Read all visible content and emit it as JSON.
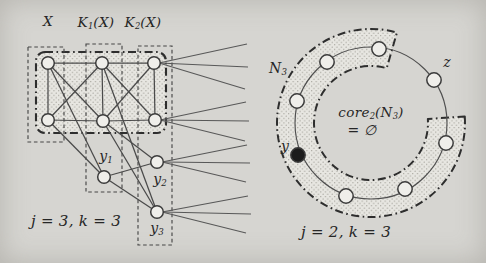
{
  "colors": {
    "paper": "#d6d5d1",
    "ink": "#4a4a4a",
    "heavy_ink": "#2e2e2e",
    "node_fill": "#efeeea",
    "filled_node": "#1c1c1c",
    "stipple_bg": "#e7e6e1",
    "stipple_dot": "#99978f"
  },
  "left_diagram": {
    "label_x": {
      "parts": [
        {
          "t": "X"
        }
      ]
    },
    "label_k1": {
      "parts": [
        {
          "t": "K"
        },
        {
          "s": "1"
        },
        {
          "t": "(X)"
        }
      ]
    },
    "label_k2": {
      "parts": [
        {
          "t": "K"
        },
        {
          "s": "2"
        },
        {
          "t": "(X)"
        }
      ]
    },
    "label_y1": {
      "parts": [
        {
          "t": "y"
        },
        {
          "s": "1"
        }
      ]
    },
    "label_y2": {
      "parts": [
        {
          "t": "y"
        },
        {
          "s": "2"
        }
      ]
    },
    "label_y3": {
      "parts": [
        {
          "t": "y"
        },
        {
          "s": "3"
        }
      ]
    },
    "caption": "j = 3, k = 3",
    "nodes": {
      "t1": [
        48,
        63
      ],
      "t2": [
        102,
        63
      ],
      "t3": [
        154,
        63
      ],
      "b1": [
        48,
        120
      ],
      "b2": [
        103,
        121
      ],
      "b3": [
        155,
        120
      ],
      "y1": [
        104,
        177
      ],
      "y2": [
        157,
        162
      ],
      "y3": [
        157,
        212
      ]
    },
    "edges": [
      [
        "t1",
        "t2"
      ],
      [
        "t2",
        "t3"
      ],
      [
        "b1",
        "b2"
      ],
      [
        "b2",
        "b3"
      ],
      [
        "t1",
        "b1"
      ],
      [
        "t2",
        "b2"
      ],
      [
        "t3",
        "b3"
      ],
      [
        "t1",
        "b2"
      ],
      [
        "b1",
        "t2"
      ],
      [
        "t2",
        "b3"
      ],
      [
        "b2",
        "t3"
      ],
      [
        "t1",
        "y1"
      ],
      [
        "b1",
        "y1"
      ],
      [
        "b2",
        "y2"
      ],
      [
        "y1",
        "y2"
      ],
      [
        "b2",
        "y3"
      ],
      [
        "t2",
        "y3"
      ],
      [
        "y1",
        "y3"
      ]
    ],
    "boxes": [
      {
        "id": "x",
        "x": 28,
        "y": 47,
        "w": 36,
        "h": 95
      },
      {
        "id": "k1x",
        "x": 86,
        "y": 44,
        "w": 36,
        "h": 148
      },
      {
        "id": "k2x",
        "x": 138,
        "y": 46,
        "w": 34,
        "h": 199
      }
    ],
    "shaded_region": {
      "x": 36,
      "y": 52,
      "w": 130,
      "h": 81,
      "rx": 9
    },
    "fans": [
      {
        "from": "t3",
        "tips": [
          [
            247,
            44
          ],
          [
            248,
            67
          ],
          [
            245,
            89
          ]
        ]
      },
      {
        "from": "b3",
        "tips": [
          [
            246,
            102
          ],
          [
            249,
            121
          ],
          [
            245,
            141
          ]
        ]
      },
      {
        "from": "y2",
        "tips": [
          [
            247,
            145
          ],
          [
            250,
            163
          ],
          [
            246,
            182
          ]
        ]
      },
      {
        "from": "y3",
        "tips": [
          [
            248,
            196
          ],
          [
            251,
            214
          ],
          [
            246,
            233
          ]
        ]
      }
    ]
  },
  "right_diagram": {
    "label_n3": {
      "parts": [
        {
          "t": "N"
        },
        {
          "s": "3"
        }
      ]
    },
    "label_z": "z",
    "label_core": {
      "parts": [
        {
          "t": "core"
        },
        {
          "s": "2"
        },
        {
          "t": "(N"
        },
        {
          "s": "3"
        },
        {
          "t": ")"
        }
      ]
    },
    "label_empty": "= ∅",
    "label_y": "y",
    "caption": "j = 2, k = 3",
    "circle": {
      "cx": 371,
      "cy": 123,
      "r": 76
    },
    "band": {
      "r_in": 57,
      "r_out": 94,
      "a0": -4,
      "a1": 286
    },
    "nodes": [
      {
        "id": "top",
        "x": 379,
        "y": 49,
        "filled": false
      },
      {
        "id": "upper-left",
        "x": 327,
        "y": 62,
        "filled": false
      },
      {
        "id": "left",
        "x": 297,
        "y": 101,
        "filled": false
      },
      {
        "id": "y",
        "x": 298,
        "y": 155,
        "filled": true
      },
      {
        "id": "bottom-left",
        "x": 346,
        "y": 196,
        "filled": false
      },
      {
        "id": "bottom-right",
        "x": 405,
        "y": 189,
        "filled": false
      },
      {
        "id": "right",
        "x": 446,
        "y": 143,
        "filled": false
      },
      {
        "id": "z",
        "x": 434,
        "y": 80,
        "filled": false
      }
    ]
  }
}
